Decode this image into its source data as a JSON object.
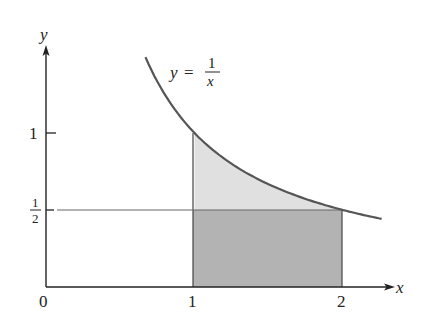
{
  "figure": {
    "type": "area-under-curve diagram",
    "equation": {
      "lhs": "y",
      "equals": "=",
      "numerator": "1",
      "denominator": "x"
    },
    "axes": {
      "x_label": "x",
      "y_label": "y",
      "x_ticks": [
        {
          "value": 0,
          "label": "0"
        },
        {
          "value": 1,
          "label": "1"
        },
        {
          "value": 2,
          "label": "2"
        }
      ],
      "y_ticks": [
        {
          "value": 1,
          "label": "1"
        },
        {
          "value": 0.5,
          "label_numerator": "1",
          "label_denominator": "2"
        }
      ]
    },
    "curve": {
      "function": "y = 1/x",
      "x_start": 0.67,
      "x_end": 2.26
    },
    "regions": [
      {
        "name": "area-between-curve-and-half",
        "x_from": 1,
        "x_to": 2,
        "y_bottom": 0.5,
        "y_top": "1/x",
        "color": "#e0e0e0"
      },
      {
        "name": "rectangle-under-half",
        "x_from": 1,
        "x_to": 2,
        "y_bottom": 0,
        "y_top": 0.5,
        "color": "#b3b3b3"
      }
    ],
    "colors": {
      "axis": "#222222",
      "curve": "#555555",
      "light_region": "#e0e0e0",
      "dark_region": "#b3b3b3",
      "reference_line": "#666666"
    }
  }
}
